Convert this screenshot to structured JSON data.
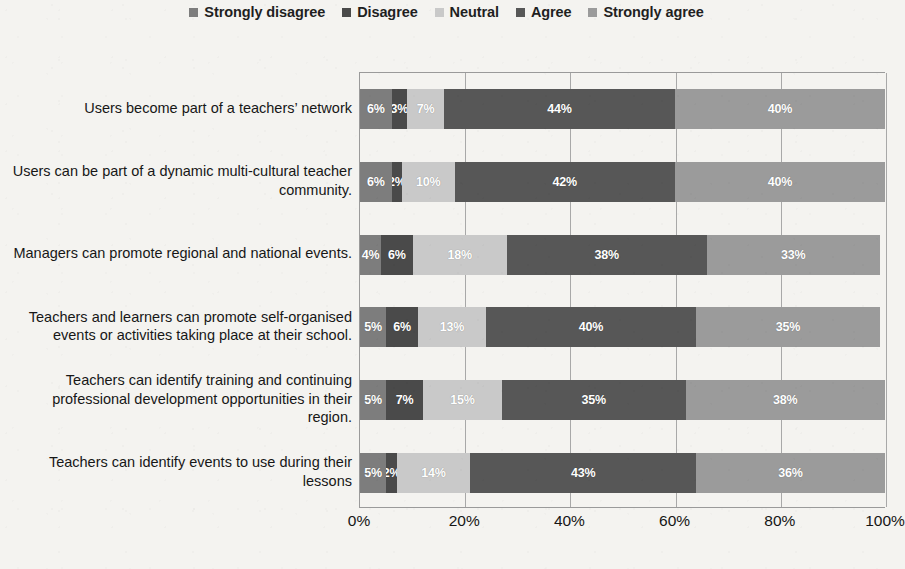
{
  "chart_data": {
    "type": "bar",
    "subtype": "100% stacked horizontal bar",
    "title": "",
    "xlabel": "",
    "ylabel": "",
    "xlim": [
      0,
      100
    ],
    "xticks": [
      "0%",
      "20%",
      "40%",
      "60%",
      "80%",
      "100%"
    ],
    "xtick_values": [
      0,
      20,
      40,
      60,
      80,
      100
    ],
    "grid": true,
    "legend_position": "top-center",
    "value_suffix": "%",
    "categories": [
      "Users become part of a teachers’ network",
      "Users can be part of a dynamic multi-cultural teacher community.",
      "Managers can promote regional and national events.",
      "Teachers and learners can promote self-organised events or activities taking place at their school.",
      "Teachers can identify training and continuing professional development opportunities in their region.",
      "Teachers can identify events to use during their lessons"
    ],
    "series": [
      {
        "name": "Strongly disagree",
        "color": "#7d7d7d",
        "values": [
          6,
          6,
          4,
          5,
          5,
          5
        ]
      },
      {
        "name": "Disagree",
        "color": "#4a4a4a",
        "values": [
          3,
          2,
          6,
          6,
          7,
          2
        ]
      },
      {
        "name": "Neutral",
        "color": "#c9c9c9",
        "values": [
          7,
          10,
          18,
          13,
          15,
          14
        ]
      },
      {
        "name": "Agree",
        "color": "#575757",
        "values": [
          44,
          42,
          38,
          40,
          35,
          43
        ]
      },
      {
        "name": "Strongly agree",
        "color": "#9b9b9b",
        "values": [
          40,
          40,
          33,
          35,
          38,
          36
        ]
      }
    ],
    "bar_labels": [
      [
        "6%",
        "3%",
        "7%",
        "44%",
        "40%"
      ],
      [
        "6%",
        "2%",
        "10%",
        "42%",
        "40%"
      ],
      [
        "4%",
        "6%",
        "18%",
        "38%",
        "33%"
      ],
      [
        "5%",
        "6%",
        "13%",
        "40%",
        "35%"
      ],
      [
        "5%",
        "7%",
        "15%",
        "35%",
        "38%"
      ],
      [
        "5%",
        "2%",
        "14%",
        "43%",
        "36%"
      ]
    ]
  },
  "legend": {
    "items": [
      {
        "label": "Strongly disagree",
        "color": "#7d7d7d"
      },
      {
        "label": "Disagree",
        "color": "#4a4a4a"
      },
      {
        "label": "Neutral",
        "color": "#c9c9c9"
      },
      {
        "label": "Agree",
        "color": "#575757"
      },
      {
        "label": "Strongly agree",
        "color": "#9b9b9b"
      }
    ]
  },
  "colors": {
    "plot_border": "#9a9a9a",
    "gridline": "#a8a8a8",
    "background": "#f4f3f0",
    "text": "#171717",
    "bar_label_text": "#ffffff"
  }
}
